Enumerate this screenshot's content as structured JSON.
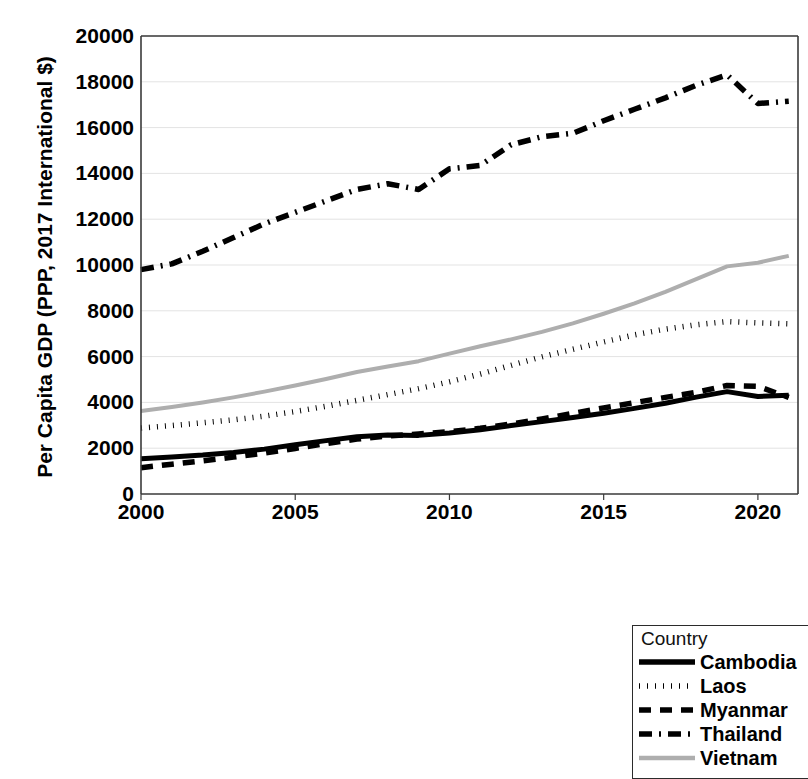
{
  "chart_data": {
    "type": "line",
    "title": "",
    "xlabel": "",
    "ylabel": "Per Capita GDP (PPP, 2017 International $)",
    "xlim": [
      2000,
      2021.3
    ],
    "ylim": [
      0,
      20000
    ],
    "grid": "horizontal",
    "legend_position": "bottom-right",
    "legend_title": "Country",
    "x": [
      2000,
      2001,
      2002,
      2003,
      2004,
      2005,
      2006,
      2007,
      2008,
      2009,
      2010,
      2011,
      2012,
      2013,
      2014,
      2015,
      2016,
      2017,
      2018,
      2019,
      2020,
      2021
    ],
    "x_ticks": [
      2000,
      2005,
      2010,
      2015,
      2020
    ],
    "y_ticks": [
      0,
      2000,
      4000,
      6000,
      8000,
      10000,
      12000,
      14000,
      16000,
      18000,
      20000
    ],
    "series": [
      {
        "name": "Cambodia",
        "style": "solid",
        "color": "#000000",
        "values": [
          1540,
          1620,
          1700,
          1810,
          1960,
          2150,
          2330,
          2500,
          2580,
          2560,
          2660,
          2810,
          2990,
          3160,
          3340,
          3530,
          3740,
          3960,
          4230,
          4470,
          4260,
          4310
        ]
      },
      {
        "name": "Laos",
        "style": "dotted",
        "color": "#000000",
        "values": [
          2880,
          2990,
          3110,
          3240,
          3400,
          3600,
          3830,
          4090,
          4340,
          4600,
          4900,
          5240,
          5620,
          5990,
          6320,
          6640,
          6950,
          7200,
          7390,
          7530,
          7470,
          7430
        ]
      },
      {
        "name": "Myanmar",
        "style": "dashed",
        "color": "#000000",
        "values": [
          1150,
          1300,
          1450,
          1610,
          1790,
          1990,
          2200,
          2400,
          2530,
          2620,
          2720,
          2870,
          3060,
          3280,
          3520,
          3760,
          3990,
          4220,
          4440,
          4740,
          4700,
          4220
        ]
      },
      {
        "name": "Thailand",
        "style": "dashdot",
        "color": "#000000",
        "values": [
          9800,
          10050,
          10600,
          11200,
          11800,
          12300,
          12800,
          13300,
          13550,
          13300,
          14200,
          14350,
          15250,
          15600,
          15750,
          16300,
          16800,
          17300,
          17850,
          18300,
          17050,
          17150
        ]
      },
      {
        "name": "Vietnam",
        "style": "solid-gray",
        "color": "#aeaeae",
        "values": [
          3620,
          3800,
          4000,
          4220,
          4470,
          4740,
          5020,
          5330,
          5570,
          5800,
          6130,
          6450,
          6750,
          7080,
          7450,
          7870,
          8320,
          8830,
          9380,
          9940,
          10100,
          10400
        ]
      }
    ]
  },
  "legend": {
    "title": "Country",
    "items": [
      {
        "label": "Cambodia",
        "style": "solid"
      },
      {
        "label": "Laos",
        "style": "dotted"
      },
      {
        "label": "Myanmar",
        "style": "dashed"
      },
      {
        "label": "Thailand",
        "style": "dashdot"
      },
      {
        "label": "Vietnam",
        "style": "solid-gray"
      }
    ]
  },
  "colors": {
    "axis": "#3a3a3a",
    "grid": "#e3e3e3",
    "series_dark": "#000000",
    "series_gray": "#aeaeae",
    "legend_border": "#2b2b2b"
  }
}
